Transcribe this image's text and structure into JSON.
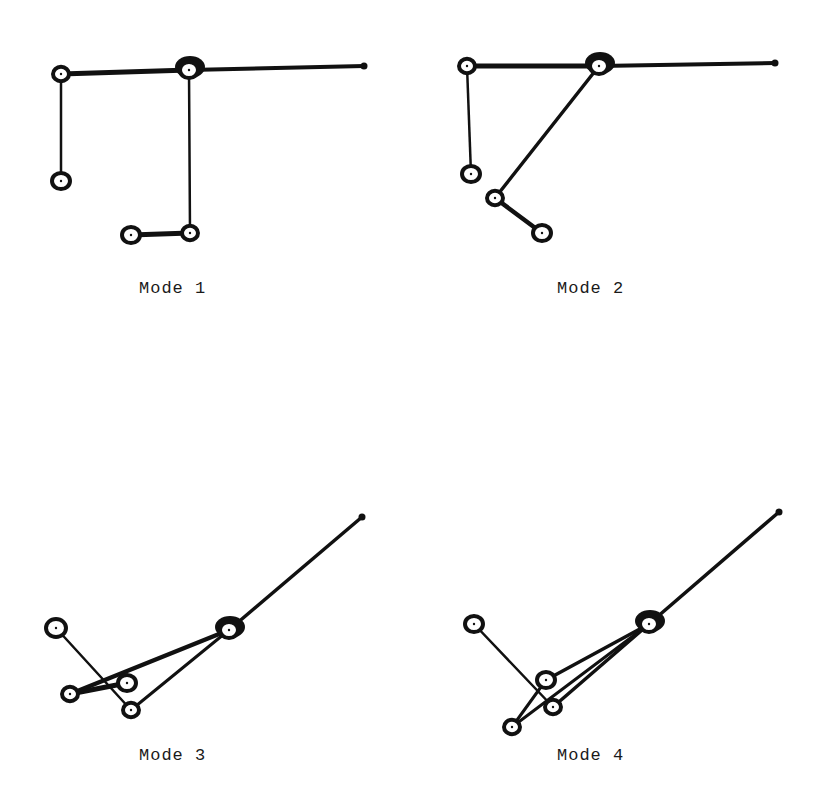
{
  "figure": {
    "panels": [
      {
        "label": "Mode 1",
        "label_pos": [
          139,
          279
        ],
        "nodes": [
          {
            "x": 61,
            "y": 74,
            "r": 8
          },
          {
            "x": 189,
            "y": 70,
            "r": 9,
            "hub": true
          },
          {
            "x": 364,
            "y": 66,
            "r": 3.5,
            "tip": true
          },
          {
            "x": 61,
            "y": 181,
            "r": 9
          },
          {
            "x": 131,
            "y": 235,
            "r": 9
          },
          {
            "x": 190,
            "y": 233,
            "r": 8
          }
        ],
        "edges": [
          {
            "a": 0,
            "b": 1,
            "w": 5
          },
          {
            "a": 1,
            "b": 2,
            "w": 4
          },
          {
            "a": 0,
            "b": 3,
            "w": 2.5
          },
          {
            "a": 1,
            "b": 5,
            "w": 2.5
          },
          {
            "a": 4,
            "b": 5,
            "w": 5
          }
        ]
      },
      {
        "label": "Mode 2",
        "label_pos": [
          557,
          279
        ],
        "nodes": [
          {
            "x": 467,
            "y": 66,
            "r": 8
          },
          {
            "x": 599,
            "y": 66,
            "r": 9,
            "hub": true
          },
          {
            "x": 775,
            "y": 63,
            "r": 3.5,
            "tip": true
          },
          {
            "x": 471,
            "y": 174,
            "r": 9
          },
          {
            "x": 495,
            "y": 198,
            "r": 8
          },
          {
            "x": 542,
            "y": 233,
            "r": 9
          }
        ],
        "edges": [
          {
            "a": 0,
            "b": 1,
            "w": 5
          },
          {
            "a": 1,
            "b": 2,
            "w": 4
          },
          {
            "a": 0,
            "b": 3,
            "w": 2.5
          },
          {
            "a": 1,
            "b": 4,
            "w": 3.5
          },
          {
            "a": 4,
            "b": 5,
            "w": 4.5
          }
        ]
      },
      {
        "label": "Mode 3",
        "label_pos": [
          139,
          746
        ],
        "nodes": [
          {
            "x": 56,
            "y": 628,
            "r": 10
          },
          {
            "x": 229,
            "y": 630,
            "r": 9,
            "hub": true
          },
          {
            "x": 362,
            "y": 517,
            "r": 3.5,
            "tip": true
          },
          {
            "x": 70,
            "y": 694,
            "r": 8
          },
          {
            "x": 127,
            "y": 683,
            "r": 9
          },
          {
            "x": 131,
            "y": 710,
            "r": 8
          }
        ],
        "edges": [
          {
            "a": 1,
            "b": 2,
            "w": 3.5
          },
          {
            "a": 0,
            "b": 5,
            "w": 2.5
          },
          {
            "a": 1,
            "b": 3,
            "w": 4.5
          },
          {
            "a": 1,
            "b": 5,
            "w": 3
          },
          {
            "a": 3,
            "b": 4,
            "w": 5
          }
        ]
      },
      {
        "label": "Mode 4",
        "label_pos": [
          557,
          746
        ],
        "nodes": [
          {
            "x": 474,
            "y": 624,
            "r": 9
          },
          {
            "x": 649,
            "y": 624,
            "r": 9,
            "hub": true
          },
          {
            "x": 779,
            "y": 512,
            "r": 3.5,
            "tip": true
          },
          {
            "x": 546,
            "y": 680,
            "r": 9
          },
          {
            "x": 553,
            "y": 707,
            "r": 8
          },
          {
            "x": 512,
            "y": 727,
            "r": 8
          }
        ],
        "edges": [
          {
            "a": 1,
            "b": 2,
            "w": 3.5
          },
          {
            "a": 0,
            "b": 4,
            "w": 2.5
          },
          {
            "a": 1,
            "b": 3,
            "w": 3.5
          },
          {
            "a": 1,
            "b": 4,
            "w": 3.5
          },
          {
            "a": 1,
            "b": 5,
            "w": 3
          },
          {
            "a": 3,
            "b": 5,
            "w": 3
          }
        ]
      }
    ],
    "colors": {
      "ink": "#111111",
      "paper": "#ffffff"
    }
  }
}
